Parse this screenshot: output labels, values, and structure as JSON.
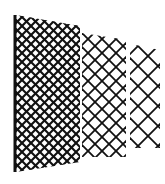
{
  "figure": {
    "colors": {
      "line": "#111111",
      "background": "#ffffff"
    },
    "panels": [
      {
        "name": "fine-mesh-panel",
        "polygon": "16,15 80,26 80,162 16,172",
        "spacing": 9,
        "stroke": 2.1,
        "pole": true
      },
      {
        "name": "medium-mesh-panel",
        "polygon": "82,33 126,40 126,157 82,157",
        "spacing": 14,
        "stroke": 1.8,
        "pole": false
      },
      {
        "name": "coarse-mesh-panel",
        "polygon": "130,44 160,50 160,148 130,148",
        "spacing": 20,
        "stroke": 1.8,
        "pole": false
      }
    ]
  }
}
